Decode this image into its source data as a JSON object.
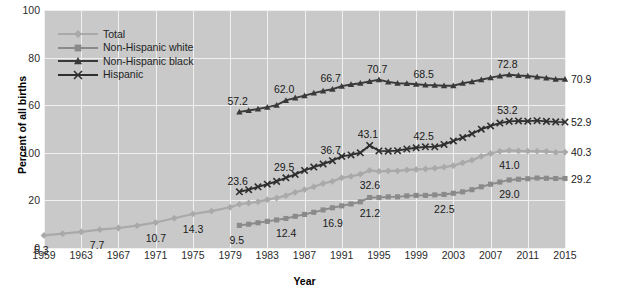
{
  "chart_data": {
    "type": "line",
    "title": "",
    "xlabel": "Year",
    "ylabel": "Percent of all births",
    "xlim": [
      1959,
      2015
    ],
    "ylim": [
      0,
      100
    ],
    "xticks": [
      "1959",
      "1963",
      "1967",
      "1971",
      "1975",
      "1979",
      "1983",
      "1987",
      "1991",
      "1995",
      "1999",
      "2003",
      "2007",
      "2011",
      "2015"
    ],
    "yticks": [
      "100",
      "80",
      "60",
      "100",
      "20",
      "0"
    ],
    "ytick_values": [
      100,
      80,
      60,
      40,
      20,
      0
    ],
    "grid": true,
    "legend_position": "upper-left",
    "series": [
      {
        "name": "Total",
        "color": "#a9a9a9",
        "marker": "diamond",
        "x": [
          1959,
          1961,
          1963,
          1965,
          1967,
          1969,
          1971,
          1973,
          1975,
          1977,
          1979,
          1980,
          1981,
          1982,
          1983,
          1984,
          1985,
          1986,
          1987,
          1988,
          1989,
          1990,
          1991,
          1992,
          1993,
          1994,
          1995,
          1996,
          1997,
          1998,
          1999,
          2000,
          2001,
          2002,
          2003,
          2004,
          2005,
          2006,
          2007,
          2008,
          2009,
          2010,
          2011,
          2012,
          2013,
          2014,
          2015
        ],
        "values": [
          5.3,
          6.0,
          6.8,
          7.7,
          8.4,
          9.4,
          10.7,
          12.5,
          14.3,
          15.5,
          17.1,
          18.4,
          18.9,
          19.4,
          20.3,
          21.0,
          22.0,
          23.4,
          24.5,
          25.7,
          27.1,
          28.0,
          29.5,
          30.1,
          31.0,
          32.6,
          32.2,
          32.4,
          32.4,
          32.8,
          33.0,
          33.2,
          33.5,
          34.0,
          34.6,
          35.8,
          36.9,
          38.5,
          39.7,
          40.6,
          41.0,
          40.8,
          40.7,
          40.7,
          40.6,
          40.2,
          40.3
        ],
        "labeled_points": [
          {
            "x": 1959,
            "value": 5.3
          },
          {
            "x": 1965,
            "value": 7.7
          },
          {
            "x": 1971,
            "value": 10.7
          },
          {
            "x": 1975,
            "value": 14.3
          },
          {
            "x": 1994,
            "value": 32.6
          },
          {
            "x": 2009,
            "value": 41.0
          }
        ],
        "end_label": "40.3"
      },
      {
        "name": "Non-Hispanic white",
        "color": "#8a8a8a",
        "marker": "square",
        "x": [
          1980,
          1981,
          1982,
          1983,
          1984,
          1985,
          1986,
          1987,
          1988,
          1989,
          1990,
          1991,
          1992,
          1993,
          1994,
          1995,
          1996,
          1997,
          1998,
          1999,
          2000,
          2001,
          2002,
          2003,
          2004,
          2005,
          2006,
          2007,
          2008,
          2009,
          2010,
          2011,
          2012,
          2013,
          2014,
          2015
        ],
        "values": [
          9.5,
          10.0,
          10.6,
          11.2,
          11.8,
          12.4,
          13.3,
          14.1,
          15.0,
          16.0,
          16.9,
          17.7,
          18.5,
          19.4,
          21.2,
          21.2,
          21.5,
          21.5,
          21.9,
          22.1,
          22.1,
          22.3,
          22.5,
          23.0,
          23.6,
          24.5,
          25.7,
          26.8,
          27.7,
          28.6,
          28.9,
          29.1,
          29.4,
          29.3,
          29.2,
          29.2
        ],
        "labeled_points": [
          {
            "x": 1980,
            "value": 9.5
          },
          {
            "x": 1985,
            "value": 12.4
          },
          {
            "x": 1990,
            "value": 16.9
          },
          {
            "x": 1994,
            "value": 21.2
          },
          {
            "x": 2002,
            "value": 22.5
          },
          {
            "x": 2009,
            "value": 29.0
          }
        ],
        "end_label": "29.2"
      },
      {
        "name": "Non-Hispanic black",
        "color": "#3a3a3a",
        "marker": "triangle",
        "x": [
          1980,
          1981,
          1982,
          1983,
          1984,
          1985,
          1986,
          1987,
          1988,
          1989,
          1990,
          1991,
          1992,
          1993,
          1994,
          1995,
          1996,
          1997,
          1998,
          1999,
          2000,
          2001,
          2002,
          2003,
          2004,
          2005,
          2006,
          2007,
          2008,
          2009,
          2010,
          2011,
          2012,
          2013,
          2014,
          2015
        ],
        "values": [
          57.2,
          57.8,
          58.4,
          59.2,
          60.0,
          62.0,
          63.1,
          64.0,
          65.1,
          66.0,
          66.7,
          68.0,
          68.7,
          69.2,
          70.0,
          70.7,
          69.8,
          69.2,
          69.1,
          68.8,
          68.5,
          68.4,
          68.2,
          68.2,
          69.2,
          69.9,
          70.7,
          71.6,
          72.3,
          72.8,
          72.5,
          72.3,
          71.9,
          71.5,
          70.9,
          70.9
        ],
        "labeled_points": [
          {
            "x": 1980,
            "value": 57.2
          },
          {
            "x": 1985,
            "value": 62.0
          },
          {
            "x": 1990,
            "value": 66.7
          },
          {
            "x": 1995,
            "value": 70.7
          },
          {
            "x": 2000,
            "value": 68.5
          },
          {
            "x": 2009,
            "value": 72.8
          }
        ],
        "end_label": "70.9"
      },
      {
        "name": "Hispanic",
        "color": "#2f2f2f",
        "marker": "x",
        "x": [
          1980,
          1981,
          1982,
          1983,
          1984,
          1985,
          1986,
          1987,
          1988,
          1989,
          1990,
          1991,
          1992,
          1993,
          1994,
          1995,
          1996,
          1997,
          1998,
          1999,
          2000,
          2001,
          2002,
          2003,
          2004,
          2005,
          2006,
          2007,
          2008,
          2009,
          2010,
          2011,
          2012,
          2013,
          2014,
          2015
        ],
        "values": [
          23.6,
          24.5,
          25.7,
          26.8,
          28.0,
          29.5,
          30.9,
          32.6,
          34.0,
          35.3,
          36.7,
          38.5,
          39.1,
          40.0,
          43.1,
          40.8,
          40.7,
          40.9,
          41.6,
          42.1,
          42.5,
          42.5,
          43.5,
          45.0,
          46.4,
          48.0,
          49.9,
          51.3,
          52.5,
          53.2,
          53.4,
          53.3,
          53.5,
          53.2,
          53.0,
          52.9
        ],
        "labeled_points": [
          {
            "x": 1980,
            "value": 23.6
          },
          {
            "x": 1985,
            "value": 29.5
          },
          {
            "x": 1990,
            "value": 36.7
          },
          {
            "x": 1994,
            "value": 43.1
          },
          {
            "x": 2000,
            "value": 42.5
          },
          {
            "x": 2009,
            "value": 53.2
          }
        ],
        "end_label": "52.9"
      }
    ]
  },
  "legend": {
    "items": [
      {
        "label": "Total"
      },
      {
        "label": "Non-Hispanic white"
      },
      {
        "label": "Non-Hispanic black"
      },
      {
        "label": "Hispanic"
      }
    ]
  },
  "axes": {
    "x_title": "Year",
    "y_title": "Percent of all births"
  },
  "colors": {
    "plot_background": "#c9c9c9",
    "gridline": "#f0f0f0",
    "total": "#a9a9a9",
    "nh_white": "#8a8a8a",
    "nh_black": "#3a3a3a",
    "hispanic": "#2f2f2f"
  }
}
